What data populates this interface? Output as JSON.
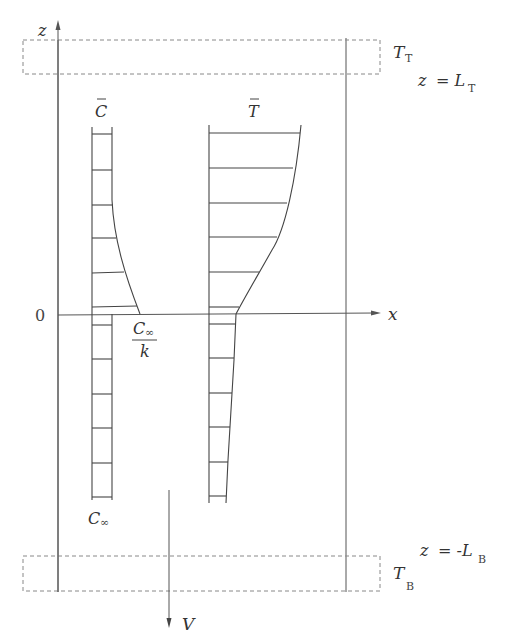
{
  "diagram": {
    "labels": {
      "z_axis": "z",
      "x_axis": "x",
      "origin": "0",
      "c_bar": "C",
      "t_bar": "T",
      "c_inf_over_k_num": "C",
      "c_inf_over_k_num_sub": "∞",
      "c_inf_over_k_den": "k",
      "c_inf_bottom": "C",
      "c_inf_bottom_sub": "∞",
      "top_boundary_temp": "T",
      "top_boundary_temp_sub": "T",
      "top_boundary_eq_lhs": "z",
      "top_boundary_eq_rhs": "= L",
      "top_boundary_eq_sub": "T",
      "bottom_boundary_eq_lhs": "z",
      "bottom_boundary_eq_rhs": "= -L",
      "bottom_boundary_eq_sub": "B",
      "bottom_boundary_temp": "T",
      "bottom_boundary_temp_sub": "B",
      "velocity": "V"
    },
    "colors": {
      "line": "#555555",
      "dashed_box": "#888888",
      "text": "#333333",
      "background": "#ffffff"
    },
    "regions": {
      "top_boundary_layer": "z = L_T, temperature T_T",
      "bottom_boundary_layer": "z = -L_B, temperature T_B"
    },
    "profiles": {
      "concentration": {
        "name": "C-bar profile",
        "description": "Constant C_inf below z=0, decreasing toward C_inf/k at interface from above"
      },
      "temperature": {
        "name": "T-bar profile",
        "description": "Increases with height above z=0, nearly linear below"
      }
    }
  }
}
